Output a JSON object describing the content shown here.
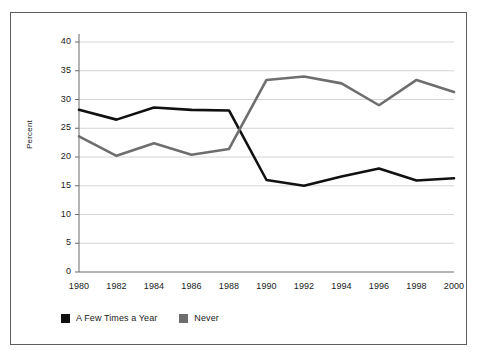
{
  "chart_data": {
    "type": "line",
    "title": "",
    "subtitle": "",
    "xlabel": "",
    "ylabel": "Percent",
    "x": [
      1980,
      1982,
      1984,
      1986,
      1988,
      1990,
      1992,
      1994,
      1996,
      1998,
      2000
    ],
    "categories": [
      "1980",
      "1982",
      "1984",
      "1986",
      "1988",
      "1990",
      "1992",
      "1994",
      "1996",
      "1998",
      "2000"
    ],
    "xlim": [
      1980,
      2000
    ],
    "ylim": [
      0,
      40
    ],
    "ytick_values": [
      0,
      5,
      10,
      15,
      20,
      25,
      30,
      35,
      40
    ],
    "ytick_labels": [
      "0",
      "5",
      "10",
      "15",
      "20",
      "25",
      "30",
      "35",
      "40"
    ],
    "grid": "horizontal",
    "legend_position": "bottom-left",
    "series": [
      {
        "name": "A Few Times a Year",
        "color": "#111111",
        "values": [
          28.2,
          26.5,
          28.6,
          28.2,
          28.1,
          16.0,
          15.0,
          16.6,
          18.0,
          15.9,
          16.3
        ]
      },
      {
        "name": "Never",
        "color": "#6e6e6e",
        "values": [
          23.6,
          20.2,
          22.4,
          20.4,
          21.4,
          33.4,
          34.0,
          32.8,
          29.0,
          33.4,
          31.3
        ]
      }
    ]
  },
  "legend": {
    "items": [
      {
        "label": "A Few Times a Year",
        "color": "#111111"
      },
      {
        "label": "Never",
        "color": "#6e6e6e"
      }
    ]
  },
  "axes": {
    "y_title": "Percent"
  },
  "style": {
    "frame_color": "#5d5d5d",
    "grid_color": "#c9c9c9",
    "axis_color": "#6a6a6a",
    "text_color": "#1a1a1a",
    "background": "#ffffff"
  }
}
